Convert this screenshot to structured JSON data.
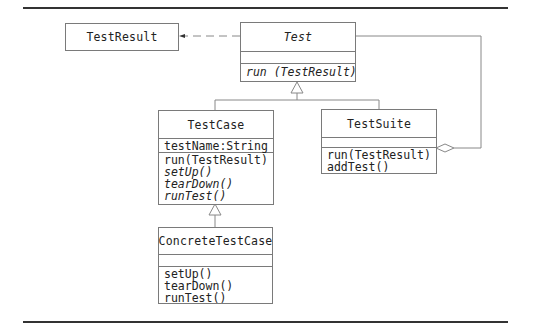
{
  "diagram": {
    "type": "UML class diagram",
    "classes": {
      "test_result": {
        "name": "TestResult",
        "attributes": [],
        "operations": []
      },
      "test": {
        "name": "Test",
        "abstract": true,
        "attributes": [],
        "operations": [
          "run (TestResult)"
        ]
      },
      "test_case": {
        "name": "TestCase",
        "attributes": [
          "testName:String"
        ],
        "operations": [
          "run(TestResult)",
          "setUp()",
          "tearDown()",
          "runTest()"
        ],
        "abstract_operations": [
          "setUp()",
          "tearDown()",
          "runTest()"
        ]
      },
      "test_suite": {
        "name": "TestSuite",
        "attributes": [],
        "operations": [
          "run(TestResult)",
          "addTest()"
        ]
      },
      "concrete_test_case": {
        "name": "ConcreteTestCase",
        "attributes": [],
        "operations": [
          "setUp()",
          "tearDown()",
          "runTest()"
        ]
      }
    },
    "relationships": [
      {
        "type": "dependency",
        "from": "Test",
        "to": "TestResult",
        "style": "dashed-arrow"
      },
      {
        "type": "generalization",
        "from": "TestCase",
        "to": "Test"
      },
      {
        "type": "generalization",
        "from": "TestSuite",
        "to": "Test"
      },
      {
        "type": "generalization",
        "from": "ConcreteTestCase",
        "to": "TestCase"
      },
      {
        "type": "aggregation",
        "whole": "TestSuite",
        "part": "Test"
      }
    ],
    "colors": {
      "rule": "#333333",
      "box_border": "#7a7a7a",
      "text": "#222222",
      "line": "#888888"
    }
  }
}
